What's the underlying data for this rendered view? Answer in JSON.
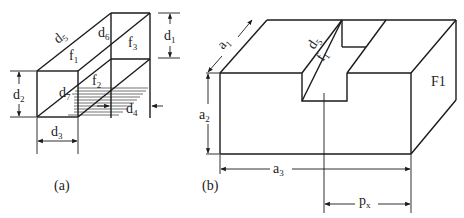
{
  "figures": [
    {
      "id": "a",
      "caption": "(a)",
      "labels": {
        "d1": {
          "base": "d",
          "sub": "1"
        },
        "d2": {
          "base": "d",
          "sub": "2"
        },
        "d3": {
          "base": "d",
          "sub": "3"
        },
        "d4": {
          "base": "d",
          "sub": "4"
        },
        "d5": {
          "base": "d",
          "sub": "5"
        },
        "d6": {
          "base": "d",
          "sub": "6"
        },
        "d7": {
          "base": "d",
          "sub": "7"
        },
        "f1": {
          "base": "f",
          "sub": "1"
        },
        "f2": {
          "base": "f",
          "sub": "2"
        },
        "f3": {
          "base": "f",
          "sub": "3"
        }
      }
    },
    {
      "id": "b",
      "caption": "(b)",
      "labels": {
        "a1": {
          "base": "a",
          "sub": "1"
        },
        "a2": {
          "base": "a",
          "sub": "2"
        },
        "a3": {
          "base": "a",
          "sub": "3"
        },
        "d5": {
          "base": "d",
          "sub": "5"
        },
        "f1": {
          "base": "f",
          "sub": "1"
        },
        "F1": "F1",
        "px": {
          "base": "p",
          "sub": "x"
        }
      }
    }
  ],
  "colors": {
    "line": "#1a1a1a",
    "background": "#ffffff"
  }
}
